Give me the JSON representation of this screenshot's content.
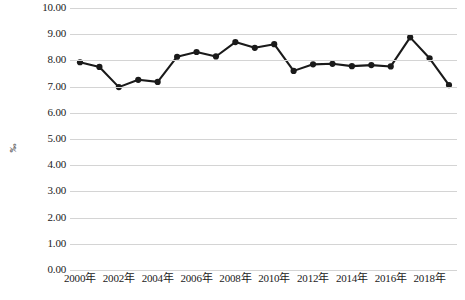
{
  "chart_data": {
    "type": "line",
    "title": "",
    "subtitle": "",
    "xlabel": "",
    "ylabel": "‰",
    "ylim": [
      0.0,
      10.0
    ],
    "ytick_step": 1.0,
    "grid": true,
    "legend": false,
    "legend_position": "none",
    "line_color": "#1a1a1a",
    "marker": "circle",
    "marker_color": "#1a1a1a",
    "background_color": "#ffffff",
    "gridline_color": "#d4d4d4",
    "y_ticks": [
      "10.00",
      "9.00",
      "8.00",
      "7.00",
      "6.00",
      "5.00",
      "4.00",
      "3.00",
      "2.00",
      "1.00",
      "0.00"
    ],
    "x_tick_labels": [
      "2000年",
      "2002年",
      "2004年",
      "2006年",
      "2008年",
      "2010年",
      "2012年",
      "2014年",
      "2016年",
      "2018年"
    ],
    "x_tick_years": [
      2000,
      2002,
      2004,
      2006,
      2008,
      2010,
      2012,
      2014,
      2016,
      2018
    ],
    "categories": [
      "2000年",
      "2001年",
      "2002年",
      "2003年",
      "2004年",
      "2005年",
      "2006年",
      "2007年",
      "2008年",
      "2009年",
      "2010年",
      "2011年",
      "2012年",
      "2013年",
      "2014年",
      "2015年",
      "2016年",
      "2017年",
      "2018年",
      "2019年"
    ],
    "x": [
      2000,
      2001,
      2002,
      2003,
      2004,
      2005,
      2006,
      2007,
      2008,
      2009,
      2010,
      2011,
      2012,
      2013,
      2014,
      2015,
      2016,
      2017,
      2018,
      2019
    ],
    "values": [
      7.93,
      7.75,
      6.98,
      7.26,
      7.18,
      8.14,
      8.32,
      8.15,
      8.7,
      8.48,
      8.62,
      7.6,
      7.85,
      7.87,
      7.78,
      7.82,
      7.77,
      8.88,
      8.08,
      7.06
    ],
    "series": [
      {
        "name": "",
        "values": [
          7.93,
          7.75,
          6.98,
          7.26,
          7.18,
          8.14,
          8.32,
          8.15,
          8.7,
          8.48,
          8.62,
          7.6,
          7.85,
          7.87,
          7.78,
          7.82,
          7.77,
          8.88,
          8.08,
          7.06
        ]
      }
    ],
    "annotations": []
  }
}
